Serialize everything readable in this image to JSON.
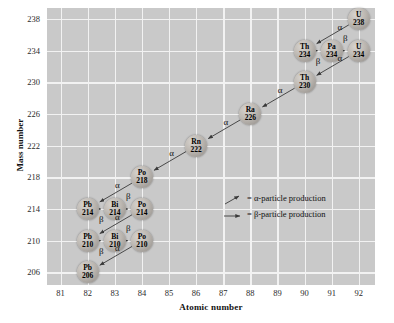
{
  "chart_data": {
    "type": "scatter",
    "title": "",
    "xlabel": "Atomic number",
    "ylabel": "Mass number",
    "xlim": [
      80.5,
      92.6
    ],
    "ylim": [
      204.4,
      239.4
    ],
    "xticks": [
      81,
      82,
      83,
      84,
      85,
      86,
      87,
      88,
      89,
      90,
      91,
      92
    ],
    "yticks": [
      206,
      210,
      214,
      218,
      222,
      226,
      230,
      234,
      238
    ],
    "grid": true,
    "legend_position": "center-right",
    "nodes": [
      {
        "symbol": "U",
        "mass": "238",
        "z": 92,
        "a": 238
      },
      {
        "symbol": "Th",
        "mass": "234",
        "z": 90,
        "a": 234
      },
      {
        "symbol": "Pa",
        "mass": "234",
        "z": 91,
        "a": 234
      },
      {
        "symbol": "U",
        "mass": "234",
        "z": 92,
        "a": 234
      },
      {
        "symbol": "Th",
        "mass": "230",
        "z": 90,
        "a": 230
      },
      {
        "symbol": "Ra",
        "mass": "226",
        "z": 88,
        "a": 226
      },
      {
        "symbol": "Rn",
        "mass": "222",
        "z": 86,
        "a": 222
      },
      {
        "symbol": "Po",
        "mass": "218",
        "z": 84,
        "a": 218
      },
      {
        "symbol": "Pb",
        "mass": "214",
        "z": 82,
        "a": 214
      },
      {
        "symbol": "Bi",
        "mass": "214",
        "z": 83,
        "a": 214
      },
      {
        "symbol": "Po",
        "mass": "214",
        "z": 84,
        "a": 214
      },
      {
        "symbol": "Pb",
        "mass": "210",
        "z": 82,
        "a": 210
      },
      {
        "symbol": "Bi",
        "mass": "210",
        "z": 83,
        "a": 210
      },
      {
        "symbol": "Po",
        "mass": "210",
        "z": 84,
        "a": 210
      },
      {
        "symbol": "Pb",
        "mass": "206",
        "z": 82,
        "a": 206
      }
    ],
    "decays": [
      {
        "from": [
          92,
          238
        ],
        "to": [
          90,
          234
        ],
        "mode": "alpha",
        "label": "α",
        "lx": 91.3,
        "ly": 236.9
      },
      {
        "from": [
          90,
          234
        ],
        "to": [
          91,
          234
        ],
        "mode": "beta",
        "label": "β",
        "lx": 90.5,
        "ly": 232.6
      },
      {
        "from": [
          91,
          234
        ],
        "to": [
          92,
          234
        ],
        "mode": "beta",
        "label": "β",
        "lx": 91.5,
        "ly": 235.5
      },
      {
        "from": [
          92,
          234
        ],
        "to": [
          90,
          230
        ],
        "mode": "alpha",
        "label": "α",
        "lx": 91.3,
        "ly": 232.9
      },
      {
        "from": [
          90,
          230
        ],
        "to": [
          88,
          226
        ],
        "mode": "alpha",
        "label": "α",
        "lx": 89.1,
        "ly": 228.9
      },
      {
        "from": [
          88,
          226
        ],
        "to": [
          86,
          222
        ],
        "mode": "alpha",
        "label": "α",
        "lx": 87.1,
        "ly": 224.9
      },
      {
        "from": [
          86,
          222
        ],
        "to": [
          84,
          218
        ],
        "mode": "alpha",
        "label": "α",
        "lx": 85.1,
        "ly": 220.9
      },
      {
        "from": [
          84,
          218
        ],
        "to": [
          82,
          214
        ],
        "mode": "alpha",
        "label": "α",
        "lx": 83.1,
        "ly": 216.9
      },
      {
        "from": [
          82,
          214
        ],
        "to": [
          83,
          214
        ],
        "mode": "beta",
        "label": "β",
        "lx": 82.5,
        "ly": 212.6
      },
      {
        "from": [
          83,
          214
        ],
        "to": [
          84,
          214
        ],
        "mode": "beta",
        "label": "β",
        "lx": 83.5,
        "ly": 215.5
      },
      {
        "from": [
          84,
          214
        ],
        "to": [
          82,
          210
        ],
        "mode": "alpha",
        "label": "α",
        "lx": 83.1,
        "ly": 212.9
      },
      {
        "from": [
          82,
          210
        ],
        "to": [
          83,
          210
        ],
        "mode": "beta",
        "label": "β",
        "lx": 82.5,
        "ly": 208.6
      },
      {
        "from": [
          83,
          210
        ],
        "to": [
          84,
          210
        ],
        "mode": "beta",
        "label": "β",
        "lx": 83.5,
        "ly": 211.5
      },
      {
        "from": [
          84,
          210
        ],
        "to": [
          82,
          206
        ],
        "mode": "alpha",
        "label": "α",
        "lx": 83.1,
        "ly": 208.9
      }
    ],
    "legend": [
      {
        "glyph": "alpha-arrow",
        "text": "= α-particle production"
      },
      {
        "glyph": "beta-arrow",
        "text": "= β-particle production"
      }
    ],
    "colors": {
      "plot_background": "#c9c9c9",
      "gridline": "#f2f2f2",
      "arrow": "#3a3a3a",
      "text": "#111111",
      "node_fill": "#bdb8b2"
    }
  }
}
